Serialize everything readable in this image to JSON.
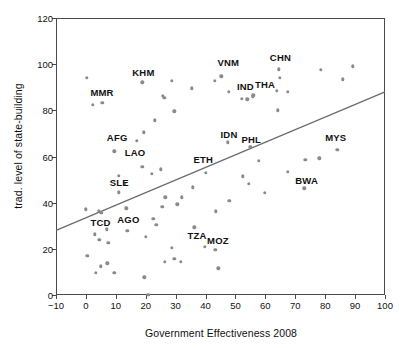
{
  "chart_data": {
    "type": "scatter",
    "title": "",
    "xlabel": "Government Effectiveness 2008",
    "ylabel": "trad. level of state-building",
    "xlim": [
      -10,
      100
    ],
    "ylim": [
      0,
      120
    ],
    "xticks": [
      -10,
      0,
      10,
      20,
      30,
      40,
      50,
      60,
      70,
      80,
      90,
      100
    ],
    "yticks": [
      0,
      20,
      40,
      60,
      80,
      100,
      120
    ],
    "grid": false,
    "legend": "none",
    "point_color": "#8a8a8a",
    "line_color": "#6b6b6b",
    "axis_color": "#4a4a4a",
    "trend_line": {
      "x1": -10,
      "y1": 28,
      "x2": 100,
      "y2": 88
    },
    "labels": [
      {
        "text": "MMR",
        "x": 1.5,
        "y": 87.5
      },
      {
        "text": "KHM",
        "x": 15.5,
        "y": 96.0
      },
      {
        "text": "VNM",
        "x": 44.0,
        "y": 100.5
      },
      {
        "text": "CHN",
        "x": 61.5,
        "y": 102.5
      },
      {
        "text": "IND",
        "x": 50.5,
        "y": 90.0
      },
      {
        "text": "THA",
        "x": 56.5,
        "y": 91.0
      },
      {
        "text": "AFG",
        "x": 7.0,
        "y": 68.0
      },
      {
        "text": "LAO",
        "x": 13.0,
        "y": 61.5
      },
      {
        "text": "SLE",
        "x": 8.0,
        "y": 48.5
      },
      {
        "text": "ETH",
        "x": 36.0,
        "y": 58.5
      },
      {
        "text": "IDN",
        "x": 45.0,
        "y": 69.5
      },
      {
        "text": "PHL",
        "x": 52.0,
        "y": 67.0
      },
      {
        "text": "MYS",
        "x": 80.0,
        "y": 68.0
      },
      {
        "text": "BWA",
        "x": 70.0,
        "y": 49.5
      },
      {
        "text": "TCD",
        "x": 1.5,
        "y": 31.0
      },
      {
        "text": "AGO",
        "x": 10.5,
        "y": 32.5
      },
      {
        "text": "TZA",
        "x": 34.0,
        "y": 25.5
      },
      {
        "text": "MOZ",
        "x": 40.5,
        "y": 23.5
      }
    ],
    "points": [
      {
        "x": 0.2,
        "y": 94.0
      },
      {
        "x": 2.3,
        "y": 82.3
      },
      {
        "x": 5.5,
        "y": 83.2
      },
      {
        "x": 18.8,
        "y": 92.2
      },
      {
        "x": 25.8,
        "y": 86.4
      },
      {
        "x": 26.2,
        "y": 85.5
      },
      {
        "x": 28.8,
        "y": 92.8
      },
      {
        "x": 23.0,
        "y": 75.6
      },
      {
        "x": 29.5,
        "y": 79.5
      },
      {
        "x": 19.3,
        "y": 70.5
      },
      {
        "x": 17.0,
        "y": 66.7
      },
      {
        "x": 9.5,
        "y": 62.2
      },
      {
        "x": 35.5,
        "y": 89.5
      },
      {
        "x": 43.0,
        "y": 92.8
      },
      {
        "x": 45.3,
        "y": 94.8
      },
      {
        "x": 47.8,
        "y": 88.0
      },
      {
        "x": 52.2,
        "y": 84.9
      },
      {
        "x": 54.0,
        "y": 84.8
      },
      {
        "x": 56.0,
        "y": 86.5
      },
      {
        "x": 55.8,
        "y": 86.0
      },
      {
        "x": 63.8,
        "y": 88.5
      },
      {
        "x": 64.5,
        "y": 97.8
      },
      {
        "x": 64.8,
        "y": 94.2
      },
      {
        "x": 67.5,
        "y": 88.0
      },
      {
        "x": 64.2,
        "y": 80.0
      },
      {
        "x": 78.5,
        "y": 97.5
      },
      {
        "x": 85.8,
        "y": 93.5
      },
      {
        "x": 89.3,
        "y": 99.0
      },
      {
        "x": 47.5,
        "y": 66.2
      },
      {
        "x": 55.0,
        "y": 64.2
      },
      {
        "x": 57.8,
        "y": 58.2
      },
      {
        "x": 73.3,
        "y": 58.5
      },
      {
        "x": 78.0,
        "y": 59.3
      },
      {
        "x": 84.0,
        "y": 62.8
      },
      {
        "x": 67.5,
        "y": 53.5
      },
      {
        "x": 73.0,
        "y": 46.2
      },
      {
        "x": 59.8,
        "y": 44.3
      },
      {
        "x": 52.5,
        "y": 51.5
      },
      {
        "x": 54.5,
        "y": 48.3
      },
      {
        "x": 48.0,
        "y": 40.8
      },
      {
        "x": 43.5,
        "y": 36.2
      },
      {
        "x": 40.0,
        "y": 53.0
      },
      {
        "x": 18.8,
        "y": 55.5
      },
      {
        "x": 22.0,
        "y": 52.5
      },
      {
        "x": 25.0,
        "y": 54.5
      },
      {
        "x": 11.0,
        "y": 51.7
      },
      {
        "x": 13.0,
        "y": 48.3
      },
      {
        "x": 11.0,
        "y": 44.5
      },
      {
        "x": 26.5,
        "y": 42.3
      },
      {
        "x": 30.5,
        "y": 39.3
      },
      {
        "x": 32.0,
        "y": 42.3
      },
      {
        "x": 35.8,
        "y": 46.6
      },
      {
        "x": 25.5,
        "y": 38.3
      },
      {
        "x": 13.5,
        "y": 37.5
      },
      {
        "x": 0.0,
        "y": 37.2
      },
      {
        "x": 4.3,
        "y": 36.5
      },
      {
        "x": 5.2,
        "y": 35.5
      },
      {
        "x": 22.5,
        "y": 33.0
      },
      {
        "x": 23.5,
        "y": 30.5
      },
      {
        "x": 13.8,
        "y": 27.8
      },
      {
        "x": 20.0,
        "y": 25.3
      },
      {
        "x": 3.0,
        "y": 26.3
      },
      {
        "x": 7.0,
        "y": 28.5
      },
      {
        "x": 4.5,
        "y": 23.8
      },
      {
        "x": 7.5,
        "y": 22.5
      },
      {
        "x": 36.2,
        "y": 29.3
      },
      {
        "x": 39.8,
        "y": 20.8
      },
      {
        "x": 43.2,
        "y": 19.5
      },
      {
        "x": 28.8,
        "y": 20.5
      },
      {
        "x": 26.3,
        "y": 14.5
      },
      {
        "x": 29.5,
        "y": 15.7
      },
      {
        "x": 31.8,
        "y": 14.5
      },
      {
        "x": 0.5,
        "y": 17.0
      },
      {
        "x": 3.3,
        "y": 9.7
      },
      {
        "x": 5.0,
        "y": 12.5
      },
      {
        "x": 7.2,
        "y": 13.8
      },
      {
        "x": 9.5,
        "y": 9.7
      },
      {
        "x": 19.5,
        "y": 7.7
      },
      {
        "x": 44.3,
        "y": 11.5
      },
      {
        "x": 20.8,
        "y": 0.2
      }
    ]
  }
}
